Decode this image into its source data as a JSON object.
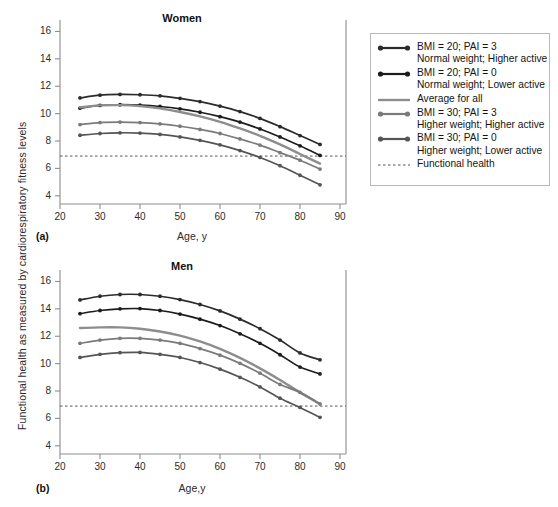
{
  "figure": {
    "y_axis_label": "Functional health as measured by cardiorespiratory fitness levels",
    "background_color": "#ffffff"
  },
  "panels": [
    {
      "letter": "(a)",
      "title": "Women",
      "x_label": "Age, y"
    },
    {
      "letter": "(b)",
      "title": "Men",
      "x_label": "Age,y"
    }
  ],
  "legend": {
    "items": [
      {
        "label": "BMI = 20; PAI = 3",
        "sublabel": "Normal weight; Higher active",
        "color": "#2b2b2b",
        "style": "line-markers"
      },
      {
        "label": "BMI = 20; PAI = 0",
        "sublabel": "Normal weight; Lower active",
        "color": "#1c1c1c",
        "style": "line-markers"
      },
      {
        "label": "Average for all",
        "sublabel": "",
        "color": "#8d8d8d",
        "style": "line-plain"
      },
      {
        "label": "BMI = 30; PAI = 3",
        "sublabel": "Higher weight; Higher active",
        "color": "#7a7a7a",
        "style": "line-markers"
      },
      {
        "label": "BMI = 30; PAI = 0",
        "sublabel": "Higher weight; Lower active",
        "color": "#555555",
        "style": "line-markers"
      },
      {
        "label": "Functional health",
        "sublabel": "",
        "color": "#555555",
        "style": "dashed"
      }
    ]
  },
  "chart_data": [
    {
      "type": "line",
      "title": "Women",
      "panel": "(a)",
      "xlabel": "Age, y",
      "ylabel": "Functional health as measured by cardiorespiratory fitness levels",
      "xlim": [
        20,
        90
      ],
      "ylim": [
        3.4,
        16.4
      ],
      "xticks": [
        20,
        30,
        40,
        50,
        60,
        70,
        80,
        90
      ],
      "yticks": [
        4,
        6,
        8,
        10,
        12,
        14,
        16
      ],
      "grid": false,
      "legend_position": "right-outside",
      "x": [
        25,
        30,
        35,
        40,
        45,
        50,
        55,
        60,
        65,
        70,
        75,
        80,
        85
      ],
      "series": [
        {
          "name": "BMI = 20; PAI = 3",
          "description": "Normal weight; Higher active",
          "color": "#2b2b2b",
          "markers": true,
          "values": [
            11.15,
            11.35,
            11.4,
            11.38,
            11.3,
            11.12,
            10.88,
            10.55,
            10.15,
            9.65,
            9.05,
            8.4,
            7.75
          ]
        },
        {
          "name": "BMI = 20; PAI = 0",
          "description": "Normal weight; Lower active",
          "color": "#1c1c1c",
          "markers": true,
          "values": [
            10.4,
            10.6,
            10.65,
            10.62,
            10.52,
            10.35,
            10.1,
            9.78,
            9.38,
            8.88,
            8.3,
            7.65,
            6.95
          ]
        },
        {
          "name": "Average for all",
          "description": "",
          "color": "#8d8d8d",
          "markers": false,
          "values": [
            10.45,
            10.6,
            10.62,
            10.55,
            10.38,
            10.12,
            9.8,
            9.4,
            8.92,
            8.38,
            7.75,
            7.05,
            6.35
          ]
        },
        {
          "name": "BMI = 30; PAI = 3",
          "description": "Higher weight; Higher active",
          "color": "#7a7a7a",
          "markers": true,
          "values": [
            9.2,
            9.35,
            9.38,
            9.35,
            9.25,
            9.08,
            8.85,
            8.55,
            8.15,
            7.7,
            7.15,
            6.6,
            5.95
          ]
        },
        {
          "name": "BMI = 30; PAI = 0",
          "description": "Higher weight; Lower active",
          "color": "#555555",
          "markers": true,
          "values": [
            8.42,
            8.55,
            8.6,
            8.58,
            8.48,
            8.3,
            8.05,
            7.72,
            7.3,
            6.8,
            6.2,
            5.5,
            4.8
          ]
        }
      ],
      "reference_line": {
        "name": "Functional health",
        "value": 6.9,
        "style": "dashed",
        "color": "#555555"
      }
    },
    {
      "type": "line",
      "title": "Men",
      "panel": "(b)",
      "xlabel": "Age,y",
      "ylabel": "Functional health as measured by cardiorespiratory fitness levels",
      "xlim": [
        20,
        90
      ],
      "ylim": [
        3.4,
        16.4
      ],
      "xticks": [
        20,
        30,
        40,
        50,
        60,
        70,
        80,
        90
      ],
      "yticks": [
        4,
        6,
        8,
        10,
        12,
        14,
        16
      ],
      "grid": false,
      "legend_position": "right-outside",
      "x": [
        25,
        30,
        35,
        40,
        45,
        50,
        55,
        60,
        65,
        70,
        75,
        80,
        85
      ],
      "series": [
        {
          "name": "BMI = 20; PAI = 3",
          "description": "Normal weight; Higher active",
          "color": "#2b2b2b",
          "markers": true,
          "values": [
            14.65,
            14.92,
            15.05,
            15.05,
            14.92,
            14.68,
            14.32,
            13.85,
            13.25,
            12.55,
            11.72,
            10.78,
            10.28
          ]
        },
        {
          "name": "BMI = 20; PAI = 0",
          "description": "Normal weight; Lower active",
          "color": "#1c1c1c",
          "markers": true,
          "values": [
            13.65,
            13.88,
            14.0,
            14.02,
            13.88,
            13.62,
            13.25,
            12.78,
            12.18,
            11.48,
            10.65,
            9.75,
            9.25
          ]
        },
        {
          "name": "Average for all",
          "description": "",
          "color": "#8d8d8d",
          "markers": false,
          "values": [
            12.6,
            12.65,
            12.65,
            12.55,
            12.35,
            12.05,
            11.62,
            11.08,
            10.42,
            9.65,
            8.8,
            7.9,
            7.05
          ]
        },
        {
          "name": "BMI = 30; PAI = 3",
          "description": "Higher weight; Higher active",
          "color": "#7a7a7a",
          "markers": true,
          "values": [
            11.48,
            11.72,
            11.85,
            11.85,
            11.72,
            11.48,
            11.1,
            10.62,
            10.02,
            9.3,
            8.48,
            7.9,
            7.05
          ]
        },
        {
          "name": "BMI = 30; PAI = 0",
          "description": "Higher weight; Lower active",
          "color": "#555555",
          "markers": true,
          "values": [
            10.45,
            10.68,
            10.8,
            10.82,
            10.68,
            10.45,
            10.08,
            9.6,
            9.0,
            8.3,
            7.48,
            6.8,
            6.08
          ]
        }
      ],
      "reference_line": {
        "name": "Functional health",
        "value": 6.9,
        "style": "dashed",
        "color": "#555555"
      }
    }
  ]
}
